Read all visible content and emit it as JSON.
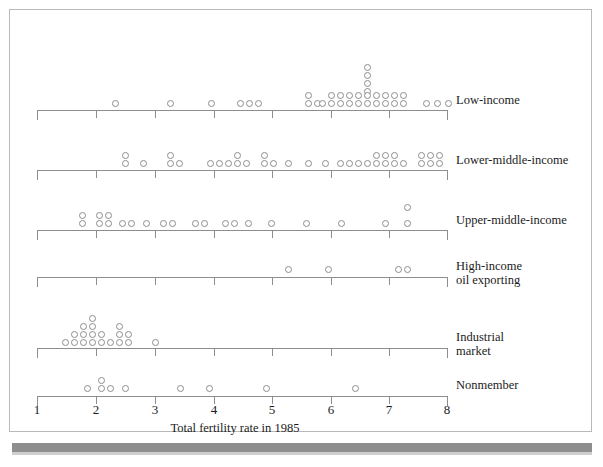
{
  "figure": {
    "axis_title": "Total fertility rate in 1985",
    "x_ticks": [
      "1",
      "2",
      "3",
      "4",
      "5",
      "6",
      "7",
      "8"
    ],
    "colors": {
      "ink": "#1b1b1b",
      "rule": "#8d8d8d",
      "frame": "#b9b9b9",
      "shadow": "#8e8e8e"
    }
  },
  "rows": [
    {
      "key": "low-income",
      "label": "Low-income",
      "label2": ""
    },
    {
      "key": "lower-middle-income",
      "label": "Lower-middle-income",
      "label2": ""
    },
    {
      "key": "upper-middle-income",
      "label": "Upper-middle-income",
      "label2": ""
    },
    {
      "key": "high-income-oil-exporting",
      "label": "High-income",
      "label2": "oil exporting"
    },
    {
      "key": "industrial-market",
      "label": "Industrial",
      "label2": "market"
    },
    {
      "key": "nonmember",
      "label": "Nonmember",
      "label2": ""
    }
  ],
  "chart_data": {
    "type": "scatter",
    "subtype": "stacked-dot-plot",
    "title": "",
    "xlabel": "Total fertility rate in 1985",
    "ylabel": "",
    "xlim": [
      1,
      8
    ],
    "xticks": [
      1,
      2,
      3,
      4,
      5,
      6,
      7,
      8
    ],
    "grid": false,
    "legend": "none",
    "group_labels": [
      "Low-income",
      "Lower-middle-income",
      "Upper-middle-income",
      "High-income oil exporting",
      "Industrial market",
      "Nonmember"
    ],
    "series": [
      {
        "name": "Low-income",
        "values": [
          2.3,
          3.2,
          3.9,
          4.4,
          4.55,
          4.7,
          5.35,
          5.35,
          5.5,
          5.9,
          5.9,
          6.0,
          6.0,
          6.1,
          6.1,
          6.2,
          6.2,
          6.3,
          6.3,
          6.35,
          6.35,
          6.35,
          6.35,
          6.35,
          6.35,
          6.35,
          6.45,
          6.45,
          6.55,
          6.55,
          6.65,
          6.75,
          6.85,
          6.95,
          6.95,
          7.05,
          7.45,
          7.6,
          7.75
        ]
      },
      {
        "name": "Lower-middle-income",
        "values": [
          2.55,
          2.55,
          2.55,
          2.85,
          3.2,
          3.2,
          3.3,
          3.95,
          4.05,
          4.15,
          4.3,
          4.3,
          4.4,
          4.55,
          4.55,
          4.7,
          4.8,
          5.05,
          5.35,
          5.55,
          5.65,
          5.75,
          5.85,
          5.95,
          6.05,
          6.05,
          6.05,
          6.15,
          6.15,
          6.35,
          6.6,
          6.6,
          6.6,
          6.7,
          6.7,
          6.7
        ]
      },
      {
        "name": "Upper-middle-income",
        "values": [
          1.85,
          1.85,
          2.05,
          2.05,
          2.15,
          2.15,
          2.4,
          2.5,
          2.7,
          2.8,
          2.95,
          3.3,
          3.4,
          3.75,
          3.85,
          4.0,
          4.4,
          4.95,
          5.5,
          6.1,
          6.5,
          6.5
        ]
      },
      {
        "name": "High-income oil exporting",
        "values": [
          5.2,
          5.9,
          7.1,
          7.25
        ]
      },
      {
        "name": "Industrial market",
        "values": [
          1.55,
          1.65,
          1.7,
          1.75,
          1.78,
          1.8,
          1.85,
          1.85,
          1.9,
          1.9,
          1.95,
          1.95,
          1.95,
          1.95,
          2.05,
          2.05,
          2.1,
          2.1,
          2.6
        ]
      },
      {
        "name": "Nonmember",
        "values": [
          1.8,
          2.0,
          2.0,
          2.05,
          2.25,
          3.55,
          3.95,
          5.0,
          5.9
        ]
      }
    ]
  },
  "dot_layout": {
    "low-income": [
      [
        112,
        100
      ],
      [
        167,
        100
      ],
      [
        208,
        100
      ],
      [
        237,
        100
      ],
      [
        246,
        100
      ],
      [
        255,
        100
      ],
      [
        305,
        92
      ],
      [
        305,
        100
      ],
      [
        314,
        100
      ],
      [
        328,
        92
      ],
      [
        328,
        100
      ],
      [
        337,
        92
      ],
      [
        337,
        100
      ],
      [
        346,
        92
      ],
      [
        346,
        100
      ],
      [
        355,
        92
      ],
      [
        355,
        100
      ],
      [
        364,
        64
      ],
      [
        364,
        72
      ],
      [
        364,
        80
      ],
      [
        364,
        88
      ],
      [
        364,
        92
      ],
      [
        364,
        100
      ],
      [
        373,
        92
      ],
      [
        373,
        100
      ],
      [
        382,
        92
      ],
      [
        382,
        100
      ],
      [
        319,
        100
      ],
      [
        391,
        100
      ],
      [
        400,
        100
      ],
      [
        391,
        92
      ],
      [
        400,
        92
      ],
      [
        423,
        100
      ],
      [
        434,
        100
      ],
      [
        445,
        100
      ]
    ],
    "lower-middle-income": [
      [
        122,
        152
      ],
      [
        122,
        160
      ],
      [
        140,
        160
      ],
      [
        167,
        152
      ],
      [
        167,
        160
      ],
      [
        176,
        160
      ],
      [
        207,
        160
      ],
      [
        216,
        160
      ],
      [
        225,
        160
      ],
      [
        234,
        152
      ],
      [
        234,
        160
      ],
      [
        243,
        160
      ],
      [
        261,
        152
      ],
      [
        261,
        160
      ],
      [
        270,
        160
      ],
      [
        285,
        160
      ],
      [
        305,
        160
      ],
      [
        322,
        160
      ],
      [
        337,
        160
      ],
      [
        346,
        160
      ],
      [
        355,
        160
      ],
      [
        364,
        160
      ],
      [
        373,
        160
      ],
      [
        373,
        152
      ],
      [
        382,
        152
      ],
      [
        382,
        160
      ],
      [
        391,
        152
      ],
      [
        391,
        160
      ],
      [
        400,
        160
      ],
      [
        418,
        152
      ],
      [
        427,
        152
      ],
      [
        436,
        152
      ],
      [
        418,
        160
      ],
      [
        427,
        160
      ],
      [
        436,
        160
      ]
    ],
    "upper-middle-income": [
      [
        79,
        212
      ],
      [
        79,
        220
      ],
      [
        96,
        212
      ],
      [
        105,
        212
      ],
      [
        96,
        220
      ],
      [
        105,
        220
      ],
      [
        119,
        220
      ],
      [
        128,
        220
      ],
      [
        143,
        220
      ],
      [
        160,
        220
      ],
      [
        169,
        220
      ],
      [
        192,
        220
      ],
      [
        201,
        220
      ],
      [
        222,
        220
      ],
      [
        231,
        220
      ],
      [
        245,
        220
      ],
      [
        268,
        220
      ],
      [
        303,
        220
      ],
      [
        338,
        220
      ],
      [
        382,
        220
      ],
      [
        404,
        204
      ],
      [
        404,
        220
      ]
    ],
    "high-income-oil-exporting": [
      [
        285,
        266
      ],
      [
        325,
        266
      ],
      [
        395,
        266
      ],
      [
        404,
        266
      ]
    ],
    "industrial-market": [
      [
        62,
        339
      ],
      [
        71,
        339
      ],
      [
        80,
        339
      ],
      [
        89,
        339
      ],
      [
        98,
        339
      ],
      [
        107,
        339
      ],
      [
        71,
        331
      ],
      [
        80,
        331
      ],
      [
        89,
        331
      ],
      [
        98,
        331
      ],
      [
        80,
        323
      ],
      [
        89,
        323
      ],
      [
        89,
        315
      ],
      [
        116,
        339
      ],
      [
        125,
        339
      ],
      [
        116,
        331
      ],
      [
        125,
        331
      ],
      [
        116,
        323
      ],
      [
        152,
        339
      ]
    ],
    "nonmember": [
      [
        84,
        385
      ],
      [
        98,
        385
      ],
      [
        107,
        385
      ],
      [
        98,
        377
      ],
      [
        122,
        385
      ],
      [
        177,
        385
      ],
      [
        206,
        385
      ],
      [
        263,
        385
      ],
      [
        352,
        385
      ]
    ]
  },
  "axes": [
    {
      "key": "low-income",
      "y": 110,
      "x0": 37,
      "x1": 447,
      "ticks": [
        37,
        96,
        155,
        214,
        272,
        331,
        389,
        447
      ],
      "end_caps": true
    },
    {
      "key": "lower-middle-income",
      "y": 170,
      "x0": 37,
      "x1": 447,
      "ticks": [
        37,
        96,
        155,
        214,
        272,
        331,
        389,
        447
      ],
      "end_caps": true
    },
    {
      "key": "upper-middle-income",
      "y": 230,
      "x0": 37,
      "x1": 447,
      "ticks": [
        37,
        96,
        155,
        214,
        272,
        331,
        389,
        447
      ],
      "end_caps": true
    },
    {
      "key": "high-income-oil-exporting",
      "y": 277,
      "x0": 37,
      "x1": 447,
      "ticks": [
        37,
        96,
        155,
        214,
        272,
        331,
        389,
        447
      ],
      "end_caps": true
    },
    {
      "key": "industrial-market",
      "y": 348,
      "x0": 37,
      "x1": 447,
      "ticks": [
        37,
        96,
        155,
        214,
        272,
        331,
        389,
        447
      ],
      "end_caps": true
    },
    {
      "key": "nonmember",
      "y": 396,
      "x0": 37,
      "x1": 447,
      "ticks": [
        37,
        96,
        155,
        214,
        272,
        331,
        389,
        447
      ],
      "end_caps": true
    }
  ],
  "row_label_pos": [
    {
      "key": "low-income",
      "x": 456,
      "y": 93
    },
    {
      "key": "lower-middle-income",
      "x": 456,
      "y": 153
    },
    {
      "key": "upper-middle-income",
      "x": 456,
      "y": 213
    },
    {
      "key": "high-income-oil-exporting",
      "x": 456,
      "y": 259
    },
    {
      "key": "industrial-market",
      "x": 456,
      "y": 330
    },
    {
      "key": "nonmember",
      "x": 456,
      "y": 378
    }
  ],
  "tick_label_pos": [
    {
      "label": "1",
      "x": 37,
      "y": 402
    },
    {
      "label": "2",
      "x": 96,
      "y": 402
    },
    {
      "label": "3",
      "x": 155,
      "y": 402
    },
    {
      "label": "4",
      "x": 214,
      "y": 402
    },
    {
      "label": "5",
      "x": 272,
      "y": 402
    },
    {
      "label": "6",
      "x": 331,
      "y": 402
    },
    {
      "label": "7",
      "x": 389,
      "y": 402
    },
    {
      "label": "8",
      "x": 447,
      "y": 402
    }
  ]
}
